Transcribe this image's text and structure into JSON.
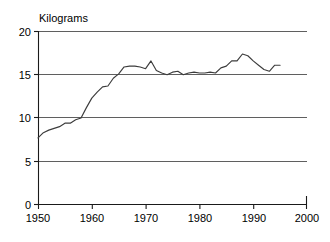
{
  "chart_data": {
    "type": "line",
    "title": "",
    "subtitle": "",
    "xlabel": "",
    "ylabel": "Kilograms",
    "ylabel_position": "top-left-above-axis",
    "xlim": [
      1950,
      2000
    ],
    "ylim": [
      0,
      20
    ],
    "grid": "horizontal",
    "legend": "none",
    "y_ticks": [
      0,
      5,
      10,
      15,
      20
    ],
    "y_tick_labels": [
      "0",
      "5",
      "10",
      "15",
      "20"
    ],
    "x_ticks": [
      1950,
      1960,
      1970,
      1980,
      1990,
      2000
    ],
    "x_tick_labels": [
      "1950",
      "1960",
      "1970",
      "1980",
      "1990",
      "2000"
    ],
    "line_color": "#3c3c3c",
    "grid_color": "#4d4d4d",
    "axis_color": "#1a1a1a",
    "series": [
      {
        "name": "Kilograms",
        "x": [
          1950,
          1951,
          1952,
          1953,
          1954,
          1955,
          1956,
          1957,
          1958,
          1959,
          1960,
          1961,
          1962,
          1963,
          1964,
          1965,
          1966,
          1967,
          1968,
          1969,
          1970,
          1971,
          1972,
          1973,
          1974,
          1975,
          1976,
          1977,
          1978,
          1979,
          1980,
          1981,
          1982,
          1983,
          1984,
          1985,
          1986,
          1987,
          1988,
          1989,
          1990,
          1991,
          1992,
          1993,
          1994,
          1995
        ],
        "values": [
          7.7,
          8.3,
          8.6,
          8.8,
          9.0,
          9.4,
          9.4,
          9.8,
          10.0,
          11.2,
          12.3,
          13.0,
          13.6,
          13.7,
          14.6,
          15.1,
          15.9,
          16.0,
          16.0,
          15.9,
          15.7,
          16.6,
          15.5,
          15.2,
          15.0,
          15.3,
          15.4,
          15.0,
          15.2,
          15.3,
          15.2,
          15.2,
          15.3,
          15.2,
          15.8,
          16.0,
          16.6,
          16.6,
          17.4,
          17.2,
          16.6,
          16.1,
          15.6,
          15.4,
          16.1,
          16.1
        ]
      }
    ]
  },
  "axis": {
    "y_title": "Kilograms"
  }
}
